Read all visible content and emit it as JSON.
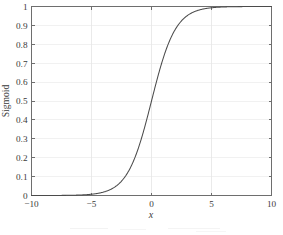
{
  "chart_data": {
    "type": "line",
    "title": "",
    "xlabel": "x",
    "ylabel": "Sigmoid",
    "xlim": [
      -10,
      10
    ],
    "ylim": [
      0,
      1
    ],
    "grid": true,
    "legend": null,
    "x_ticks": [
      -10,
      -5,
      0,
      5,
      10
    ],
    "x_tick_labels": [
      "−10",
      "−5",
      "0",
      "5",
      "10"
    ],
    "y_ticks": [
      0,
      0.1,
      0.2,
      0.3,
      0.4,
      0.5,
      0.6,
      0.7,
      0.8,
      0.9,
      1
    ],
    "y_tick_labels": [
      "0",
      "0.1",
      "0.2",
      "0.3",
      "0.4",
      "0.5",
      "0.6",
      "0.7",
      "0.8",
      "0.9",
      "1"
    ],
    "series": [
      {
        "name": "Sigmoid",
        "color": "#4b4b4b",
        "formula": "1 / (1 + exp(-x))",
        "x": [
          -10,
          -9.5,
          -9,
          -8.5,
          -8,
          -7.5,
          -7,
          -6.5,
          -6,
          -5.5,
          -5,
          -4.5,
          -4,
          -3.5,
          -3,
          -2.5,
          -2,
          -1.5,
          -1,
          -0.5,
          0,
          0.5,
          1,
          1.5,
          2,
          2.5,
          3,
          3.5,
          4,
          4.5,
          5,
          5.5,
          6,
          6.5,
          7,
          7.5,
          8,
          8.5,
          9,
          9.5,
          10
        ],
        "values": [
          4.54e-05,
          7.49e-05,
          0.0001234,
          0.0002035,
          0.0003354,
          0.0005527,
          0.000911,
          0.0015012,
          0.0024726,
          0.0040701,
          0.0066929,
          0.0109869,
          0.0179862,
          0.0293122,
          0.0474259,
          0.0758582,
          0.1192029,
          0.1824255,
          0.2689414,
          0.3775407,
          0.5,
          0.6224593,
          0.7310586,
          0.8175745,
          0.8807971,
          0.9241418,
          0.9525741,
          0.9706877,
          0.9820138,
          0.9890131,
          0.9933071,
          0.9959299,
          0.9975274,
          0.998499,
          0.999089,
          0.9994473,
          0.9996646,
          0.9997965,
          0.9998766,
          0.9999251,
          0.9999546
        ]
      }
    ]
  },
  "axes": {
    "y_axis_label": "Sigmoid",
    "x_axis_label": "x"
  },
  "colors": {
    "curve": "#4b4b4b",
    "frame": "#6e6e6e",
    "grid": "#efefef",
    "text": "#3a3a3a",
    "background": "#ffffff"
  }
}
